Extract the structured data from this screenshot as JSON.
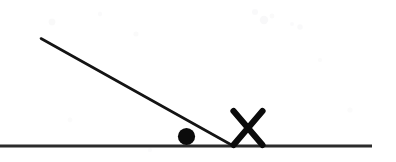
{
  "figure": {
    "title": "Ball on an inclined line meeting a horizontal ground line, with an X marker",
    "caption": "",
    "width": 396,
    "height": 162,
    "background_color": "#ffffff",
    "ink_color": "#0d0d0d",
    "ground_color": "#2b2b2b"
  },
  "elements": {
    "ground_line": {
      "label": "ground-line",
      "x1": 0,
      "y1": 146,
      "x2": 372,
      "y2": 146,
      "stroke_width": 3.2,
      "color": "#2b2b2b"
    },
    "incline_line": {
      "label": "incline-line",
      "x1": 41,
      "y1": 38.5,
      "x2": 232.5,
      "y2": 145.5,
      "stroke_width": 2.6,
      "color": "#141414"
    },
    "ball": {
      "label": "ball",
      "cx": 186.5,
      "cy": 136.5,
      "r": 8.6,
      "color": "#0b0b0b"
    },
    "x_marker": {
      "label": "cross-marker",
      "cx": 248,
      "cy": 128,
      "half_width": 14.5,
      "half_height": 17,
      "stroke_width": 6.2,
      "color": "#0b0b0b"
    }
  },
  "scan_artifacts": [
    {
      "cx": 52,
      "cy": 22,
      "r": 3.4,
      "opacity": 0.055
    },
    {
      "cx": 100,
      "cy": 14,
      "r": 2.2,
      "opacity": 0.04
    },
    {
      "cx": 136,
      "cy": 34,
      "r": 2.6,
      "opacity": 0.045
    },
    {
      "cx": 255,
      "cy": 12,
      "r": 3.0,
      "opacity": 0.05
    },
    {
      "cx": 264,
      "cy": 20,
      "r": 4.2,
      "opacity": 0.06
    },
    {
      "cx": 272,
      "cy": 16,
      "r": 2.4,
      "opacity": 0.045
    },
    {
      "cx": 292,
      "cy": 24,
      "r": 2.0,
      "opacity": 0.04
    },
    {
      "cx": 300,
      "cy": 27,
      "r": 2.8,
      "opacity": 0.05
    },
    {
      "cx": 320,
      "cy": 60,
      "r": 2.2,
      "opacity": 0.035
    },
    {
      "cx": 70,
      "cy": 120,
      "r": 2.4,
      "opacity": 0.035
    },
    {
      "cx": 350,
      "cy": 110,
      "r": 2.6,
      "opacity": 0.035
    },
    {
      "cx": 150,
      "cy": 150,
      "r": 2.2,
      "opacity": 0.03
    }
  ]
}
